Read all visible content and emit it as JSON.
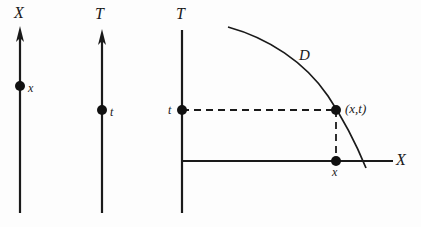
{
  "figure": {
    "background_color": "#fdfdfd",
    "ink_color": "#1a1a1a",
    "width": 421,
    "height": 227
  },
  "panel_x_axis": {
    "name": "standalone-space-axis",
    "axis_label": "X",
    "point_label": "x",
    "axis_label_pos": {
      "x": 14,
      "y": 5
    },
    "point_label_pos": {
      "x": 28,
      "y": 82
    },
    "line": {
      "x": 20,
      "y_top": 27,
      "y_bottom": 213
    },
    "point": {
      "x": 20,
      "y": 86,
      "r": 5
    },
    "arrow": {
      "tip_x": 20,
      "tip_y": 27,
      "half_width": 4,
      "height": 15
    }
  },
  "panel_t_axis": {
    "name": "standalone-time-axis",
    "axis_label": "T",
    "point_label": "t",
    "axis_label_pos": {
      "x": 95,
      "y": 6
    },
    "point_label_pos": {
      "x": 110,
      "y": 106
    },
    "line": {
      "x": 102,
      "y_top": 30,
      "y_bottom": 213
    },
    "point": {
      "x": 102,
      "y": 110,
      "r": 5
    },
    "arrow": {
      "tip_x": 102,
      "tip_y": 30,
      "half_width": 4,
      "height": 15
    }
  },
  "panel_combined": {
    "name": "combined-spacetime-diagram",
    "time_axis_label": "T",
    "space_axis_label": "X",
    "time_point_label": "t",
    "space_point_label": "x",
    "curve_label": "D",
    "coordinate_label": "(x,t)",
    "time_axis_label_pos": {
      "x": 176,
      "y": 6
    },
    "space_axis_label_pos": {
      "x": 396,
      "y": 152
    },
    "time_point_label_pos": {
      "x": 168,
      "y": 104
    },
    "space_point_label_pos": {
      "x": 332,
      "y": 166
    },
    "curve_label_pos": {
      "x": 299,
      "y": 48
    },
    "coordinate_label_pos": {
      "x": 345,
      "y": 102
    },
    "vertical_axis": {
      "x": 182,
      "y_top": 30,
      "y_bottom": 213
    },
    "horizontal_axis": {
      "y": 161,
      "x_left": 182,
      "x_right": 393
    },
    "point_t": {
      "x": 182,
      "y": 110,
      "r": 5
    },
    "point_x": {
      "x": 336,
      "y": 161,
      "r": 5
    },
    "point_xt": {
      "x": 336,
      "y": 110,
      "r": 5
    },
    "dashed_horizontal": {
      "y": 110,
      "x_from": 182,
      "x_to": 336
    },
    "dashed_vertical": {
      "x": 336,
      "y_from": 110,
      "y_to": 161
    },
    "curve_path": "M 228 27 C 268 38, 305 62, 328 96 C 344 120, 357 146, 366 168",
    "dash_pattern": "7,5"
  }
}
